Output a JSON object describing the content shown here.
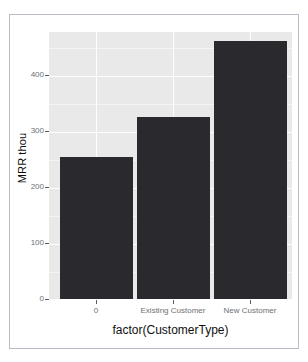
{
  "chart_data": {
    "type": "bar",
    "title": "",
    "subtitle": "",
    "xlabel": "factor(CustomerType)",
    "ylabel": "MRR thou",
    "categories": [
      "0",
      "Existing Customer",
      "New Customer"
    ],
    "values": [
      250,
      320,
      455
    ],
    "ylim": [
      0,
      470
    ],
    "y_ticks": [
      "0",
      "100",
      "200",
      "300",
      "400"
    ],
    "y_tick_values": [
      0,
      100,
      200,
      300,
      400
    ],
    "x_ticks": [
      "0",
      "Existing Customer",
      "New Customer"
    ],
    "grid": true,
    "legend": "none",
    "bar_color": "#2a2a2e",
    "panel_color": "#e9e9ea",
    "grid_color": "#fdfdfd",
    "axis_text_color": "#6d6f74",
    "axis_title_color": "#0f0f0f"
  },
  "plot": {
    "y_axis": {
      "title": "MRR thou",
      "ticks": [
        {
          "label": "400",
          "value": 400
        },
        {
          "label": "300",
          "value": 300
        },
        {
          "label": "200",
          "value": 200
        },
        {
          "label": "100",
          "value": 100
        },
        {
          "label": "0",
          "value": 0
        }
      ]
    },
    "x_axis": {
      "title": "factor(CustomerType)",
      "ticks": [
        {
          "label": "0"
        },
        {
          "label": "Existing Customer"
        },
        {
          "label": "New Customer"
        }
      ]
    },
    "bars": [
      {
        "category": "0",
        "value": 250
      },
      {
        "category": "Existing Customer",
        "value": 320
      },
      {
        "category": "New Customer",
        "value": 455
      }
    ]
  }
}
